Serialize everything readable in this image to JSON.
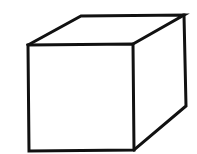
{
  "diagram": {
    "type": "wireframe-cube",
    "stroke_color": "#111111",
    "background_color": "#ffffff",
    "stroke_width": 3,
    "vertices": {
      "front_top_left": [
        28,
        45
      ],
      "front_top_right": [
        133,
        44
      ],
      "front_bottom_right": [
        134,
        150
      ],
      "front_bottom_left": [
        29,
        151
      ],
      "back_top_left": [
        81,
        16
      ],
      "back_top_right": [
        184,
        15
      ],
      "back_bottom_right": [
        186,
        106
      ]
    }
  }
}
